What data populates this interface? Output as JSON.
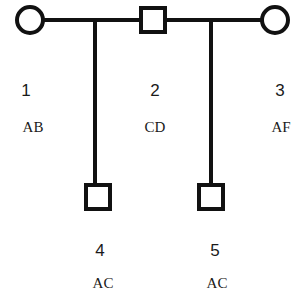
{
  "diagram": {
    "type": "pedigree",
    "colors": {
      "stroke": "#111111",
      "fill": "#ffffff",
      "text": "#1a1a1a"
    },
    "individuals": [
      {
        "id": "1",
        "sex": "female",
        "shape": "circle",
        "genotype": "AB",
        "generation": 1
      },
      {
        "id": "2",
        "sex": "male",
        "shape": "square",
        "genotype": "CD",
        "generation": 1
      },
      {
        "id": "3",
        "sex": "female",
        "shape": "circle",
        "genotype": "AF",
        "generation": 1
      },
      {
        "id": "4",
        "sex": "male",
        "shape": "square",
        "genotype": "AC",
        "generation": 2
      },
      {
        "id": "5",
        "sex": "male",
        "shape": "square",
        "genotype": "AC",
        "generation": 2
      }
    ],
    "unions": [
      {
        "partners": [
          "1",
          "2"
        ],
        "children": [
          "4"
        ]
      },
      {
        "partners": [
          "2",
          "3"
        ],
        "children": [
          "5"
        ]
      }
    ]
  }
}
